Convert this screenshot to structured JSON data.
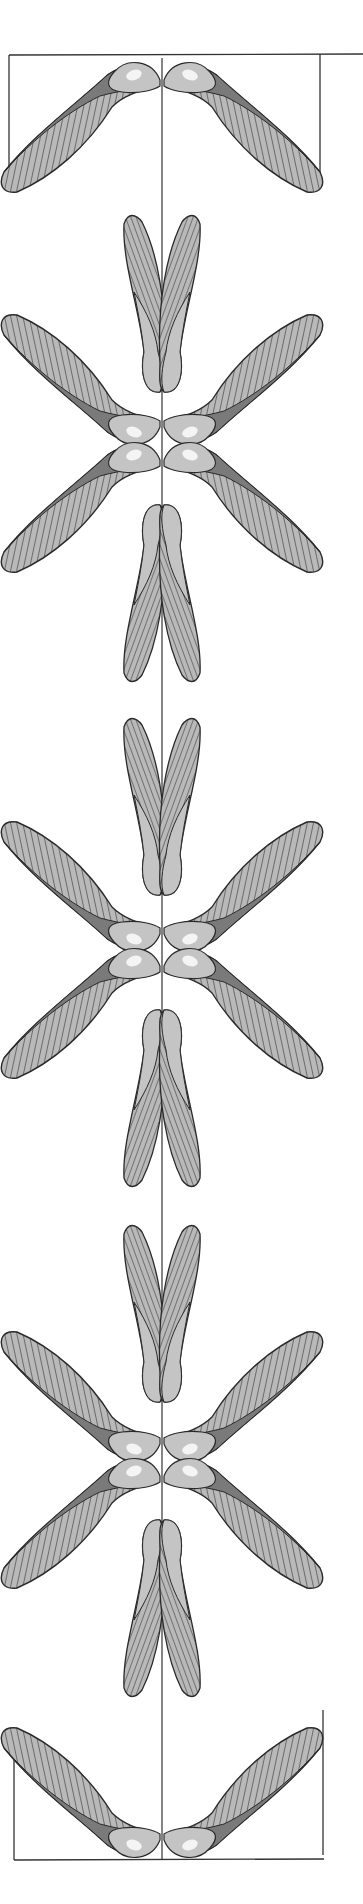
{
  "illustration": {
    "title": "Maple samaras (winged seeds) symmetric arrangement",
    "subject": "Paired maple samaras arranged along a vertical axis",
    "colors": {
      "background": "#ffffff",
      "outline": "#2a2a2a",
      "wing_fill": "#b9b9b9",
      "seed_fill": "#c4c4c4",
      "seed_shadow": "#7a7a7a",
      "highlight": "#f4f4f4",
      "axis_line": "#333333"
    },
    "frame_top": {
      "x": 9,
      "y": 55,
      "width": 311,
      "height": 130
    },
    "frame_bottom": {
      "x": 14,
      "y": 1720,
      "width": 310,
      "height": 100
    },
    "axis_x": 162,
    "pairs": [
      {
        "type": "spread-down",
        "cy": 80
      },
      {
        "type": "upright-v",
        "cy": 390
      },
      {
        "type": "spread-up",
        "cy": 420
      },
      {
        "type": "spread-down",
        "cy": 455
      },
      {
        "type": "hanging",
        "cy": 505
      },
      {
        "type": "upright-v",
        "cy": 895
      },
      {
        "type": "spread-up",
        "cy": 930
      },
      {
        "type": "spread-down",
        "cy": 965
      },
      {
        "type": "hanging",
        "cy": 1010
      },
      {
        "type": "upright-v",
        "cy": 1400
      },
      {
        "type": "spread-up",
        "cy": 1440
      },
      {
        "type": "spread-down",
        "cy": 1475
      },
      {
        "type": "hanging",
        "cy": 1520
      },
      {
        "type": "spread-up",
        "cy": 1835
      }
    ]
  }
}
